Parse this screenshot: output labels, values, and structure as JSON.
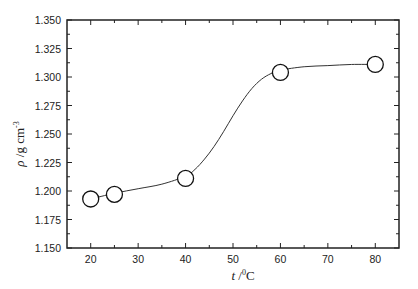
{
  "chart_data": {
    "type": "scatter",
    "title": "",
    "xlabel": "t /⁰C",
    "xlabel_parts": {
      "var": "t",
      "sep": " /",
      "sup": "0",
      "unit": "C"
    },
    "ylabel": "ρ /g cm⁻³",
    "ylabel_parts": {
      "var": "ρ",
      "unit": " /g cm",
      "sup": "-3"
    },
    "xlim": [
      15,
      85
    ],
    "ylim": [
      1.15,
      1.35
    ],
    "xticks": [
      20,
      30,
      40,
      50,
      60,
      70,
      80
    ],
    "xtick_labels": [
      "20",
      "30",
      "40",
      "50",
      "60",
      "70",
      "80"
    ],
    "yticks": [
      1.15,
      1.175,
      1.2,
      1.225,
      1.25,
      1.275,
      1.3,
      1.325,
      1.35
    ],
    "ytick_labels": [
      "1.150",
      "1.175",
      "1.200",
      "1.225",
      "1.250",
      "1.275",
      "1.300",
      "1.325",
      "1.350"
    ],
    "grid": false,
    "legend": null,
    "series": [
      {
        "name": "density",
        "marker": "open-circle",
        "x": [
          20,
          25,
          40,
          60,
          80
        ],
        "y": [
          1.193,
          1.197,
          1.211,
          1.304,
          1.311
        ]
      }
    ],
    "fit_curve": {
      "type": "sigmoidal",
      "description": "smooth sigmoid fit through points",
      "x": [
        20,
        25,
        30,
        35,
        40,
        42,
        44,
        46,
        48,
        50,
        52,
        54,
        56,
        58,
        60,
        65,
        70,
        75,
        80
      ],
      "y": [
        1.193,
        1.198,
        1.202,
        1.206,
        1.213,
        1.219,
        1.228,
        1.239,
        1.252,
        1.266,
        1.279,
        1.29,
        1.298,
        1.303,
        1.306,
        1.309,
        1.31,
        1.311,
        1.311
      ]
    },
    "colors": {
      "axis": "#222222",
      "marker_stroke": "#111111",
      "marker_fill": "#ffffff",
      "line": "#333333"
    }
  }
}
